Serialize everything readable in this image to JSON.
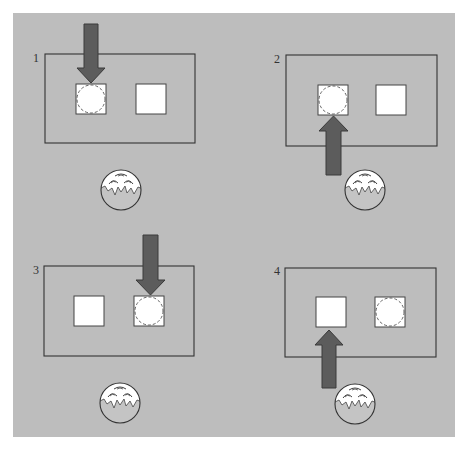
{
  "figure": {
    "background_color": "#bdbdbd",
    "arrow_color": "#5c5c5c",
    "box_fill": "#ffffff",
    "panels": [
      {
        "label": "1",
        "arrow_direction": "down",
        "arrow_target": "left-box",
        "circle_in_box": "left-box"
      },
      {
        "label": "2",
        "arrow_direction": "up",
        "arrow_target": "left-box",
        "circle_in_box": "left-box"
      },
      {
        "label": "3",
        "arrow_direction": "down",
        "arrow_target": "right-box",
        "circle_in_box": "right-box"
      },
      {
        "label": "4",
        "arrow_direction": "up",
        "arrow_target": "left-box",
        "circle_in_box": "right-box"
      }
    ]
  },
  "icons": {
    "face": "hatching-egg-face-icon",
    "arrow": "thick-arrow-icon",
    "target_circle": "dashed-circle-icon"
  }
}
